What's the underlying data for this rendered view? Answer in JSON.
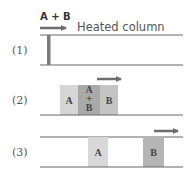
{
  "diagram": {
    "title": "Heated column",
    "injection_label": "A + B",
    "colors": {
      "line": "#666666",
      "arrow": "#6e6e6e",
      "injection_bar": "#7a7a7a",
      "band_light": "#d6d6d6",
      "band_mixed": "#a9a9a9",
      "band_b": "#bdbdbd",
      "band_b_stage3": "#b5b5b5"
    },
    "stages": [
      {
        "label": "(1)",
        "bands": []
      },
      {
        "label": "(2)",
        "bands": [
          {
            "label": "A"
          },
          {
            "label_top": "A",
            "label_mid": "+",
            "label_bot": "B"
          },
          {
            "label": "B"
          }
        ]
      },
      {
        "label": "(3)",
        "bands": [
          {
            "label": "A"
          },
          {
            "label": "B"
          }
        ]
      }
    ]
  }
}
